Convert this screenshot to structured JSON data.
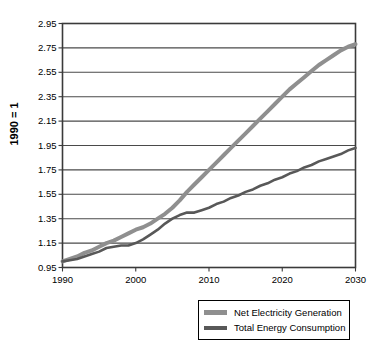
{
  "chart_data": {
    "type": "line",
    "title": "",
    "xlabel": "",
    "ylabel": "1990 = 1",
    "xlim": [
      1990,
      2030
    ],
    "ylim": [
      0.95,
      2.95
    ],
    "ytick_step": 0.2,
    "grid": true,
    "legend_position": "bottom-right",
    "xticks": [
      "1990",
      "2000",
      "2010",
      "2020",
      "2030"
    ],
    "xtick_values": [
      1990,
      2000,
      2010,
      2020,
      2030
    ],
    "yticks": [
      "0.95",
      "1.15",
      "1.35",
      "1.55",
      "1.75",
      "1.95",
      "2.15",
      "2.35",
      "2.55",
      "2.75",
      "2.95"
    ],
    "ytick_values": [
      0.95,
      1.15,
      1.35,
      1.55,
      1.75,
      1.95,
      2.15,
      2.35,
      2.55,
      2.75,
      2.95
    ],
    "x": [
      1990,
      1991,
      1992,
      1993,
      1994,
      1995,
      1996,
      1997,
      1998,
      1999,
      2000,
      2001,
      2002,
      2003,
      2004,
      2005,
      2006,
      2007,
      2008,
      2009,
      2010,
      2011,
      2012,
      2013,
      2014,
      2015,
      2016,
      2017,
      2018,
      2019,
      2020,
      2021,
      2022,
      2023,
      2024,
      2025,
      2026,
      2027,
      2028,
      2029,
      2030
    ],
    "series": [
      {
        "name": "Net Electricity Generation",
        "color": "#8f8f8f",
        "width": 4.0,
        "values": [
          1.0,
          1.02,
          1.04,
          1.07,
          1.09,
          1.12,
          1.15,
          1.17,
          1.2,
          1.23,
          1.26,
          1.28,
          1.31,
          1.35,
          1.39,
          1.44,
          1.5,
          1.57,
          1.63,
          1.69,
          1.75,
          1.81,
          1.87,
          1.93,
          1.99,
          2.05,
          2.11,
          2.17,
          2.23,
          2.29,
          2.35,
          2.41,
          2.46,
          2.51,
          2.56,
          2.61,
          2.65,
          2.69,
          2.73,
          2.76,
          2.78
        ]
      },
      {
        "name": "Total Energy Consumption",
        "color": "#585858",
        "width": 2.6,
        "values": [
          1.0,
          1.01,
          1.02,
          1.04,
          1.06,
          1.08,
          1.11,
          1.12,
          1.13,
          1.13,
          1.15,
          1.18,
          1.22,
          1.26,
          1.31,
          1.35,
          1.38,
          1.4,
          1.4,
          1.42,
          1.44,
          1.47,
          1.49,
          1.52,
          1.54,
          1.57,
          1.59,
          1.62,
          1.64,
          1.67,
          1.69,
          1.72,
          1.74,
          1.77,
          1.79,
          1.82,
          1.84,
          1.86,
          1.88,
          1.91,
          1.93
        ]
      }
    ]
  },
  "legend": {
    "items": [
      {
        "label": "Net Electricity Generation",
        "color": "#8f8f8f"
      },
      {
        "label": "Total Energy Consumption",
        "color": "#585858"
      }
    ]
  },
  "axis": {
    "y_label": "1990 = 1",
    "frame_color": "#3a3a3a",
    "grid_color": "#4a4a4a"
  }
}
